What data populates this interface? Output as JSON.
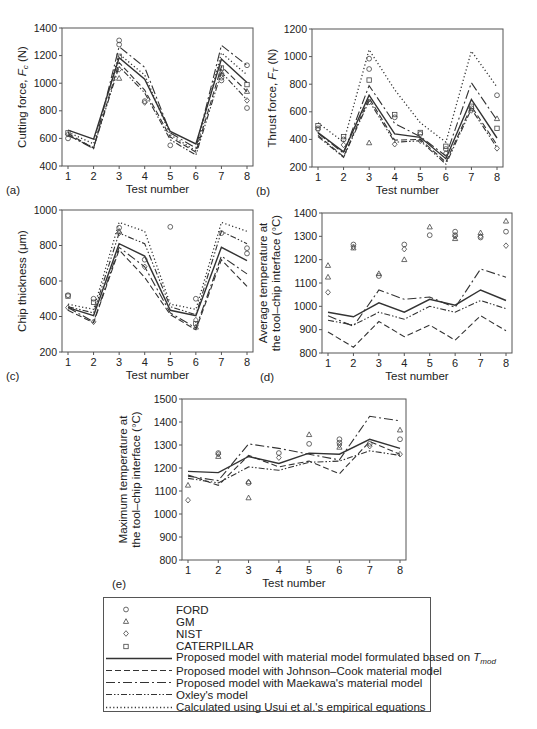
{
  "figure": {
    "x_tick_labels": [
      "1",
      "2",
      "3",
      "4",
      "5",
      "6",
      "7",
      "8"
    ],
    "x_label": "Test number"
  },
  "legend": {
    "items": [
      {
        "key": "ford",
        "label": "FORD",
        "kind": "marker",
        "marker": "circle"
      },
      {
        "key": "gm",
        "label": "GM",
        "kind": "marker",
        "marker": "triangle"
      },
      {
        "key": "nist",
        "label": "NIST",
        "kind": "marker",
        "marker": "diamond"
      },
      {
        "key": "caterpillar",
        "label": "CATERPILLAR",
        "kind": "marker",
        "marker": "square"
      },
      {
        "key": "tmod",
        "label": "Proposed model with material model formulated based on T",
        "label_sub": "mod",
        "kind": "line",
        "dash": "solid"
      },
      {
        "key": "jc",
        "label": "Proposed model with Johnson–Cook material model",
        "kind": "line",
        "dash": "dashed"
      },
      {
        "key": "maekawa",
        "label": "Proposed model with Maekawa's material model",
        "kind": "line",
        "dash": "long-dash-dot"
      },
      {
        "key": "oxley",
        "label": "Oxley's model",
        "kind": "line",
        "dash": "dash-dot-dot"
      },
      {
        "key": "usui",
        "label": "Calculated using Usui et al.'s empirical equations",
        "kind": "line",
        "dash": "dotted"
      }
    ]
  },
  "chart_data": [
    {
      "panel": "(a)",
      "type": "line",
      "title": "",
      "xlabel": "Test number",
      "ylabel": "Cutting force, F_c (N)",
      "ylabel_main": "Cutting force, ",
      "ylabel_var": "F",
      "ylabel_sub": "c",
      "ylabel_unit": " (N)",
      "categories": [
        1,
        2,
        3,
        4,
        5,
        6,
        7,
        8
      ],
      "ylim": [
        400,
        1400
      ],
      "yticks": [
        400,
        600,
        800,
        1000,
        1200,
        1400
      ],
      "grid": false,
      "frame": {
        "x0": 62,
        "y0": 28,
        "x1": 253,
        "y1": 166
      },
      "series": [
        {
          "name": "tmod",
          "values": [
            660,
            595,
            1185,
            1030,
            650,
            560,
            1175,
            1005
          ]
        },
        {
          "name": "jc",
          "values": [
            635,
            530,
            1150,
            950,
            610,
            500,
            1120,
            940
          ]
        },
        {
          "name": "maekawa",
          "values": [
            625,
            525,
            1265,
            1115,
            640,
            530,
            1275,
            1130
          ]
        },
        {
          "name": "oxley",
          "values": [
            620,
            535,
            1120,
            930,
            590,
            480,
            1080,
            880
          ]
        },
        {
          "name": "usui",
          "values": [
            645,
            560,
            1210,
            1060,
            625,
            510,
            1220,
            1060
          ]
        }
      ],
      "points": [
        {
          "name": "ford",
          "marker": "circle",
          "values": [
            [
              1,
              600
            ],
            [
              3,
              1310
            ],
            [
              3,
              1280
            ],
            [
              4,
              870
            ],
            [
              5,
              550
            ],
            [
              7,
              1040
            ],
            [
              7,
              1020
            ],
            [
              8,
              1130
            ],
            [
              8,
              820
            ]
          ]
        },
        {
          "name": "gm",
          "marker": "triangle",
          "values": [
            [
              3,
              1035
            ],
            [
              7,
              1080
            ],
            [
              8,
              940
            ]
          ]
        },
        {
          "name": "nist",
          "marker": "diamond",
          "values": [
            [
              1,
              630
            ],
            [
              3,
              1100
            ],
            [
              4,
              860
            ],
            [
              7,
              1060
            ],
            [
              8,
              875
            ]
          ]
        },
        {
          "name": "caterpillar",
          "marker": "square",
          "values": [
            [
              1,
              640
            ],
            [
              3,
              1195
            ],
            [
              7,
              1110
            ],
            [
              8,
              990
            ]
          ]
        }
      ]
    },
    {
      "panel": "(b)",
      "type": "line",
      "title": "",
      "xlabel": "Test number",
      "ylabel": "Thrust force, F_T (N)",
      "ylabel_main": "Thrust force, ",
      "ylabel_var": "F",
      "ylabel_sub": "T",
      "ylabel_unit": " (N)",
      "categories": [
        1,
        2,
        3,
        4,
        5,
        6,
        7,
        8
      ],
      "ylim": [
        200,
        1200
      ],
      "yticks": [
        200,
        400,
        600,
        800,
        1000,
        1200
      ],
      "grid": false,
      "frame": {
        "x0": 312,
        "y0": 29,
        "x1": 503,
        "y1": 167
      },
      "series": [
        {
          "name": "tmod",
          "values": [
            450,
            310,
            720,
            440,
            415,
            260,
            690,
            410
          ]
        },
        {
          "name": "jc",
          "values": [
            430,
            275,
            700,
            395,
            400,
            235,
            640,
            360
          ]
        },
        {
          "name": "maekawa",
          "values": [
            445,
            300,
            790,
            515,
            420,
            280,
            810,
            540
          ]
        },
        {
          "name": "oxley",
          "values": [
            420,
            270,
            680,
            380,
            390,
            220,
            620,
            340
          ]
        },
        {
          "name": "usui",
          "values": [
            520,
            380,
            1050,
            760,
            520,
            380,
            1040,
            780
          ]
        }
      ],
      "points": [
        {
          "name": "ford",
          "marker": "circle",
          "values": [
            [
              1,
              480
            ],
            [
              2,
              400
            ],
            [
              3,
              985
            ],
            [
              3,
              910
            ],
            [
              4,
              560
            ],
            [
              5,
              440
            ],
            [
              6,
              330
            ],
            [
              7,
              625
            ],
            [
              8,
              720
            ]
          ]
        },
        {
          "name": "gm",
          "marker": "triangle",
          "values": [
            [
              3,
              375
            ],
            [
              8,
              550
            ]
          ]
        },
        {
          "name": "nist",
          "marker": "diamond",
          "values": [
            [
              1,
              470
            ],
            [
              2,
              360
            ],
            [
              3,
              670
            ],
            [
              4,
              365
            ],
            [
              5,
              390
            ],
            [
              6,
              300
            ],
            [
              7,
              610
            ],
            [
              8,
              335
            ]
          ]
        },
        {
          "name": "caterpillar",
          "marker": "square",
          "values": [
            [
              1,
              500
            ],
            [
              2,
              420
            ],
            [
              3,
              830
            ],
            [
              4,
              580
            ],
            [
              5,
              450
            ],
            [
              6,
              350
            ],
            [
              7,
              640
            ],
            [
              8,
              480
            ]
          ]
        }
      ]
    },
    {
      "panel": "(c)",
      "type": "line",
      "title": "",
      "xlabel": "Test number",
      "ylabel": "Chip thickness (μm)",
      "ylabel_main": "Chip thickness (μm)",
      "categories": [
        1,
        2,
        3,
        4,
        5,
        6,
        7,
        8
      ],
      "ylim": [
        200,
        1000
      ],
      "yticks": [
        200,
        400,
        600,
        800,
        1000
      ],
      "grid": false,
      "frame": {
        "x0": 62,
        "y0": 210,
        "x1": 253,
        "y1": 352
      },
      "series": [
        {
          "name": "tmod",
          "values": [
            450,
            405,
            810,
            740,
            435,
            405,
            790,
            715
          ]
        },
        {
          "name": "jc",
          "values": [
            435,
            365,
            775,
            620,
            410,
            325,
            720,
            570
          ]
        },
        {
          "name": "maekawa",
          "values": [
            450,
            370,
            790,
            680,
            420,
            335,
            740,
            640
          ]
        },
        {
          "name": "oxley",
          "values": [
            455,
            420,
            870,
            810,
            455,
            410,
            880,
            810
          ]
        },
        {
          "name": "usui",
          "values": [
            470,
            440,
            930,
            880,
            470,
            440,
            930,
            880
          ]
        }
      ],
      "points": [
        {
          "name": "ford",
          "marker": "circle",
          "values": [
            [
              1,
              520
            ],
            [
              2,
              500
            ],
            [
              3,
              900
            ],
            [
              4,
              720
            ],
            [
              5,
              905
            ],
            [
              6,
              500
            ],
            [
              7,
              870
            ],
            [
              8,
              785
            ],
            [
              8,
              755
            ]
          ]
        },
        {
          "name": "gm",
          "marker": "triangle",
          "values": [
            [
              3,
              880
            ],
            [
              6,
              340
            ]
          ]
        },
        {
          "name": "nist",
          "marker": "diamond",
          "values": [
            [
              1,
              450
            ],
            [
              2,
              370
            ],
            [
              3,
              870
            ],
            [
              4,
              680
            ],
            [
              6,
              380
            ]
          ]
        },
        {
          "name": "caterpillar",
          "marker": "square",
          "values": [
            [
              1,
              515
            ],
            [
              2,
              480
            ],
            [
              6,
              360
            ]
          ]
        }
      ]
    },
    {
      "panel": "(d)",
      "type": "line",
      "title": "",
      "xlabel": "Test number",
      "ylabel": "Average temperature at the tool–chip interface (°C)",
      "ylabel_line1": "Average temperature at",
      "ylabel_line2": "the tool–chip interface (°C)",
      "categories": [
        1,
        2,
        3,
        4,
        5,
        6,
        7,
        8
      ],
      "ylim": [
        800,
        1400
      ],
      "yticks": [
        800,
        900,
        1000,
        1100,
        1200,
        1300,
        1400
      ],
      "grid": false,
      "frame": {
        "x0": 322,
        "y0": 213,
        "x1": 512,
        "y1": 353
      },
      "series": [
        {
          "name": "tmod",
          "values": [
            975,
            955,
            1015,
            975,
            1030,
            1005,
            1070,
            1025
          ]
        },
        {
          "name": "jc",
          "values": [
            890,
            825,
            935,
            870,
            920,
            855,
            960,
            895
          ]
        },
        {
          "name": "maekawa",
          "values": [
            960,
            915,
            1070,
            1030,
            1040,
            995,
            1160,
            1125
          ]
        },
        {
          "name": "oxley",
          "values": [
            940,
            920,
            975,
            945,
            1000,
            975,
            1025,
            990
          ]
        }
      ],
      "points": [
        {
          "name": "ford",
          "marker": "circle",
          "values": [
            [
              2,
              1265
            ],
            [
              3,
              1130
            ],
            [
              4,
              1265
            ],
            [
              5,
              1305
            ],
            [
              6,
              1320
            ],
            [
              6,
              1305
            ],
            [
              7,
              1295
            ],
            [
              8,
              1320
            ]
          ]
        },
        {
          "name": "gm",
          "marker": "triangle",
          "values": [
            [
              1,
              1175
            ],
            [
              1,
              1125
            ],
            [
              2,
              1250
            ],
            [
              3,
              1140
            ],
            [
              4,
              1200
            ],
            [
              5,
              1340
            ],
            [
              6,
              1290
            ],
            [
              7,
              1315
            ],
            [
              8,
              1365
            ]
          ]
        },
        {
          "name": "nist",
          "marker": "diamond",
          "values": [
            [
              1,
              1060
            ],
            [
              2,
              1255
            ],
            [
              4,
              1245
            ],
            [
              6,
              1300
            ],
            [
              7,
              1300
            ],
            [
              8,
              1260
            ]
          ]
        }
      ]
    },
    {
      "panel": "(e)",
      "type": "line",
      "title": "",
      "xlabel": "Test number",
      "ylabel": "Maximum temperature at the tool–chip interface (°C)",
      "ylabel_line1": "Maximum temperature at",
      "ylabel_line2": "the tool–chip interface (°C)",
      "categories": [
        1,
        2,
        3,
        4,
        5,
        6,
        7,
        8
      ],
      "ylim": [
        800,
        1500
      ],
      "yticks": [
        800,
        900,
        1000,
        1100,
        1200,
        1300,
        1400,
        1500
      ],
      "grid": false,
      "frame": {
        "x0": 182,
        "y0": 399,
        "x1": 406,
        "y1": 560
      },
      "series": [
        {
          "name": "tmod",
          "values": [
            1185,
            1180,
            1250,
            1220,
            1265,
            1260,
            1325,
            1285
          ]
        },
        {
          "name": "jc",
          "values": [
            1170,
            1125,
            1255,
            1205,
            1230,
            1175,
            1315,
            1260
          ]
        },
        {
          "name": "maekawa",
          "values": [
            1165,
            1145,
            1305,
            1285,
            1260,
            1235,
            1425,
            1405
          ]
        },
        {
          "name": "oxley",
          "values": [
            1155,
            1135,
            1205,
            1190,
            1225,
            1230,
            1275,
            1255
          ]
        }
      ],
      "points": [
        {
          "name": "ford",
          "marker": "circle",
          "values": [
            [
              2,
              1265
            ],
            [
              3,
              1135
            ],
            [
              4,
              1265
            ],
            [
              5,
              1305
            ],
            [
              6,
              1325
            ],
            [
              6,
              1310
            ],
            [
              7,
              1305
            ],
            [
              8,
              1325
            ]
          ]
        },
        {
          "name": "gm",
          "marker": "triangle",
          "values": [
            [
              1,
              1125
            ],
            [
              2,
              1250
            ],
            [
              3,
              1070
            ],
            [
              3,
              1140
            ],
            [
              5,
              1345
            ],
            [
              6,
              1290
            ],
            [
              8,
              1365
            ]
          ]
        },
        {
          "name": "nist",
          "marker": "diamond",
          "values": [
            [
              1,
              1060
            ],
            [
              2,
              1260
            ],
            [
              4,
              1245
            ],
            [
              6,
              1300
            ],
            [
              7,
              1295
            ],
            [
              8,
              1260
            ]
          ]
        }
      ]
    }
  ],
  "panel_labels": [
    "(a)",
    "(b)",
    "(c)",
    "(d)",
    "(e)"
  ]
}
